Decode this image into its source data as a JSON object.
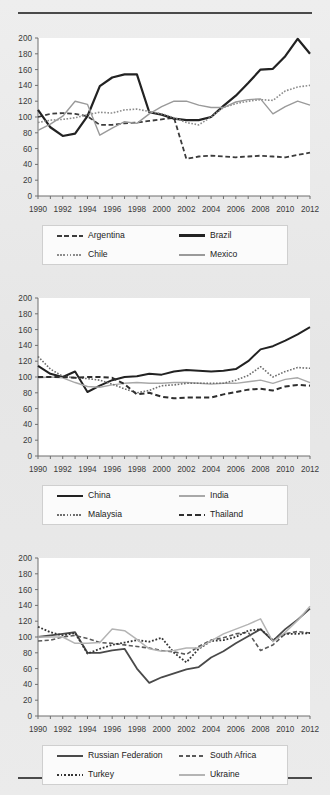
{
  "page": {
    "background_color": "#e9e9e9",
    "rule_color": "#4a4a4a"
  },
  "axis": {
    "y_ticks": [
      "0",
      "20",
      "40",
      "60",
      "80",
      "100",
      "120",
      "140",
      "160",
      "180",
      "200"
    ],
    "x_ticks": [
      "1990",
      "1992",
      "1994",
      "1996",
      "1998",
      "2000",
      "2002",
      "2004",
      "2006",
      "2008",
      "2010",
      "2012"
    ],
    "ylim": [
      0,
      200
    ],
    "xlim": [
      1990,
      2012
    ],
    "grid": false
  },
  "chart_data": [
    {
      "type": "line",
      "title": "",
      "xlabel": "",
      "ylabel": "",
      "ylim": [
        0,
        200
      ],
      "xlim": [
        1990,
        2012
      ],
      "grid": false,
      "legend_position": "bottom",
      "x": [
        1990,
        1991,
        1992,
        1993,
        1994,
        1995,
        1996,
        1997,
        1998,
        1999,
        2000,
        2001,
        2002,
        2003,
        2004,
        2005,
        2006,
        2007,
        2008,
        2009,
        2010,
        2011,
        2012
      ],
      "series": [
        {
          "name": "Argentina",
          "style": "dashed",
          "color": "#3c3c3c",
          "width": 1.8,
          "values": [
            100,
            104,
            105,
            104,
            101,
            90,
            90,
            92,
            93,
            95,
            97,
            99,
            47,
            50,
            51,
            50,
            49,
            50,
            51,
            50,
            49,
            52,
            55
          ]
        },
        {
          "name": "Brazil",
          "style": "solid",
          "color": "#222222",
          "width": 2.2,
          "values": [
            109,
            87,
            76,
            79,
            101,
            139,
            150,
            154,
            154,
            106,
            103,
            98,
            96,
            96,
            100,
            114,
            127,
            143,
            160,
            161,
            177,
            199,
            180
          ]
        },
        {
          "name": "Chile",
          "style": "dotted",
          "color": "#8c8c8c",
          "width": 1.6,
          "values": [
            93,
            96,
            97,
            99,
            103,
            106,
            105,
            109,
            110,
            107,
            104,
            99,
            93,
            90,
            100,
            112,
            117,
            120,
            122,
            121,
            133,
            138,
            140
          ]
        },
        {
          "name": "Mexico",
          "style": "solid",
          "color": "#9a9a9a",
          "width": 1.4,
          "values": [
            83,
            91,
            101,
            120,
            116,
            77,
            86,
            94,
            92,
            104,
            113,
            120,
            120,
            115,
            112,
            112,
            119,
            122,
            123,
            104,
            113,
            120,
            115
          ]
        }
      ]
    },
    {
      "type": "line",
      "title": "",
      "xlabel": "",
      "ylabel": "",
      "ylim": [
        0,
        200
      ],
      "xlim": [
        1990,
        2012
      ],
      "grid": false,
      "legend_position": "bottom",
      "x": [
        1990,
        1991,
        1992,
        1993,
        1994,
        1995,
        1996,
        1997,
        1998,
        1999,
        2000,
        2001,
        2002,
        2003,
        2004,
        2005,
        2006,
        2007,
        2008,
        2009,
        2010,
        2011,
        2012
      ],
      "series": [
        {
          "name": "China",
          "style": "solid",
          "color": "#222222",
          "width": 2.0,
          "values": [
            114,
            104,
            100,
            107,
            81,
            89,
            96,
            100,
            101,
            104,
            103,
            107,
            109,
            108,
            107,
            108,
            110,
            120,
            135,
            139,
            146,
            154,
            163
          ]
        },
        {
          "name": "India",
          "style": "solid",
          "color": "#a8a8a8",
          "width": 1.4,
          "values": [
            99,
            100,
            99,
            93,
            88,
            87,
            90,
            92,
            93,
            92,
            92,
            93,
            93,
            92,
            91,
            92,
            92,
            94,
            96,
            92,
            97,
            99,
            93
          ]
        },
        {
          "name": "Malaysia",
          "style": "dotted",
          "color": "#6e6e6e",
          "width": 1.6,
          "values": [
            126,
            110,
            101,
            99,
            98,
            96,
            91,
            85,
            80,
            83,
            89,
            90,
            92,
            92,
            92,
            92,
            96,
            102,
            113,
            100,
            107,
            112,
            111
          ]
        },
        {
          "name": "Thailand",
          "style": "dashed",
          "color": "#2e2e2e",
          "width": 2.0,
          "values": [
            100,
            100,
            100,
            99,
            100,
            100,
            99,
            91,
            78,
            80,
            75,
            73,
            74,
            74,
            74,
            78,
            81,
            84,
            85,
            83,
            88,
            90,
            89
          ]
        }
      ]
    },
    {
      "type": "line",
      "title": "",
      "xlabel": "",
      "ylabel": "",
      "ylim": [
        0,
        200
      ],
      "xlim": [
        1990,
        2012
      ],
      "grid": false,
      "legend_position": "bottom",
      "x": [
        1990,
        1991,
        1992,
        1993,
        1994,
        1995,
        1996,
        1997,
        1998,
        1999,
        2000,
        2001,
        2002,
        2003,
        2004,
        2005,
        2006,
        2007,
        2008,
        2009,
        2010,
        2011,
        2012
      ],
      "series": [
        {
          "name": "Russian Federation",
          "style": "solid",
          "color": "#4a4a4a",
          "width": 1.8,
          "values": [
            100,
            102,
            104,
            106,
            80,
            80,
            83,
            85,
            60,
            42,
            49,
            54,
            59,
            62,
            74,
            82,
            92,
            101,
            110,
            95,
            110,
            122,
            136
          ]
        },
        {
          "name": "South Africa",
          "style": "dashed",
          "color": "#5a5a5a",
          "width": 1.6,
          "values": [
            95,
            96,
            100,
            102,
            98,
            93,
            92,
            90,
            88,
            86,
            83,
            81,
            78,
            88,
            96,
            99,
            104,
            106,
            83,
            90,
            104,
            107,
            105
          ]
        },
        {
          "name": "Turkey",
          "style": "dotted",
          "color": "#333333",
          "width": 1.8,
          "values": [
            113,
            106,
            102,
            105,
            79,
            85,
            90,
            93,
            96,
            94,
            99,
            80,
            68,
            85,
            95,
            96,
            100,
            108,
            110,
            96,
            104,
            104,
            105
          ]
        },
        {
          "name": "Ukraine",
          "style": "solid",
          "color": "#b4b4b4",
          "width": 1.5,
          "values": [
            100,
            100,
            100,
            92,
            92,
            93,
            110,
            108,
            97,
            85,
            82,
            83,
            86,
            86,
            95,
            104,
            110,
            116,
            123,
            94,
            106,
            121,
            139
          ]
        }
      ]
    }
  ]
}
